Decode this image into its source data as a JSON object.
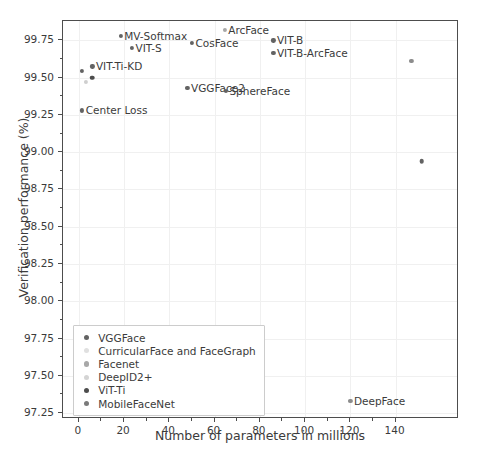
{
  "chart_data": {
    "type": "scatter",
    "title": "",
    "xlabel": "Number of parameters in millions",
    "ylabel": "Verification performance (%)",
    "xlim": [
      -7,
      168
    ],
    "ylim": [
      97.21,
      99.88
    ],
    "xticks": [
      0,
      20,
      40,
      60,
      80,
      100,
      120,
      140
    ],
    "yticks": [
      97.25,
      97.5,
      97.75,
      98.0,
      98.25,
      98.5,
      98.75,
      99.0,
      99.25,
      99.5,
      99.75
    ],
    "ytick_labels": [
      "97.25",
      "97.50",
      "97.75",
      "98.00",
      "98.25",
      "98.50",
      "98.75",
      "99.00",
      "99.25",
      "99.50",
      "99.75"
    ],
    "xtick_labels": [
      "0",
      "20",
      "40",
      "60",
      "80",
      "100",
      "120",
      "140"
    ],
    "grid": true,
    "legend_position": "lower left",
    "points": [
      {
        "label": "Center Loss",
        "x": 1.5,
        "y": 99.28,
        "color": "#636363",
        "size": 4.2,
        "label_side": "right"
      },
      {
        "label": "",
        "x": 1.5,
        "y": 99.545,
        "color": "#636363",
        "size": 4.2,
        "label_side": "right"
      },
      {
        "label": "",
        "x": 3.0,
        "y": 99.47,
        "color": "#cfcfcf",
        "size": 4.2,
        "label_side": "right"
      },
      {
        "label": "VIT-Ti-KD",
        "x": 6.0,
        "y": 99.575,
        "color": "#636363",
        "size": 4.2,
        "label_side": "right"
      },
      {
        "label": "",
        "x": 5.8,
        "y": 99.5,
        "color": "#4d4d4d",
        "size": 4.6,
        "label_side": "right"
      },
      {
        "label": "MV-Softmax",
        "x": 18.5,
        "y": 99.78,
        "color": "#636363",
        "size": 4.2,
        "label_side": "right"
      },
      {
        "label": "VIT-S",
        "x": 23.5,
        "y": 99.7,
        "color": "#636363",
        "size": 4.2,
        "label_side": "right"
      },
      {
        "label": "VGGFace2",
        "x": 48.0,
        "y": 99.43,
        "color": "#636363",
        "size": 4.2,
        "label_side": "right"
      },
      {
        "label": "CosFace",
        "x": 50.0,
        "y": 99.735,
        "color": "#636363",
        "size": 4.2,
        "label_side": "right"
      },
      {
        "label": "SphereFace",
        "x": 65.0,
        "y": 99.41,
        "color": "#636363",
        "size": 4.2,
        "label_side": "right"
      },
      {
        "label": "ArcFace",
        "x": 64.5,
        "y": 99.82,
        "color": "#a8a8a8",
        "size": 4.2,
        "label_side": "right"
      },
      {
        "label": "VIT-B",
        "x": 86.0,
        "y": 99.75,
        "color": "#636363",
        "size": 4.2,
        "label_side": "right"
      },
      {
        "label": "VIT-B-ArcFace",
        "x": 86.0,
        "y": 99.665,
        "color": "#636363",
        "size": 4.2,
        "label_side": "right"
      },
      {
        "label": "",
        "x": 147.0,
        "y": 99.615,
        "color": "#8c8c8c",
        "size": 4.2,
        "label_side": "right"
      },
      {
        "label": "",
        "x": 151.5,
        "y": 98.94,
        "color": "#636363",
        "size": 4.6,
        "label_side": "right"
      },
      {
        "label": "DeepFace",
        "x": 120.0,
        "y": 97.33,
        "color": "#8c8c8c",
        "size": 4.2,
        "label_side": "right"
      }
    ],
    "legend": [
      {
        "label": "VGGFace",
        "color": "#636363"
      },
      {
        "label": "CurricularFace and FaceGraph",
        "color": "#e0e0e0"
      },
      {
        "label": "Facenet",
        "color": "#a8a8a8"
      },
      {
        "label": "DeepID2+",
        "color": "#d4d4d4"
      },
      {
        "label": "ViT-Ti",
        "color": "#4d4d4d"
      },
      {
        "label": "MobileFaceNet",
        "color": "#7a7a7a"
      }
    ]
  }
}
